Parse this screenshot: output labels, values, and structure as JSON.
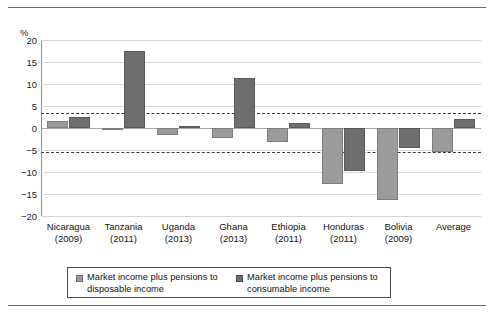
{
  "figure": {
    "y_axis_unit": "%",
    "y_ticks": [
      "20",
      "15",
      "10",
      "5",
      "0",
      "-5",
      "-10",
      "-15",
      "-20"
    ]
  },
  "legend": {
    "items": [
      {
        "swatch": "light",
        "line1": "Market income plus pensions to",
        "line2": "disposable income"
      },
      {
        "swatch": "dark",
        "line1": "Market income plus pensions to",
        "line2": "consumable income"
      }
    ]
  },
  "categories": [
    {
      "name": "Nicaragua",
      "year": "(2009)"
    },
    {
      "name": "Tanzania",
      "year": "(2011)"
    },
    {
      "name": "Uganda",
      "year": "(2013)"
    },
    {
      "name": "Ghana",
      "year": "(2013)"
    },
    {
      "name": "Ethiopia",
      "year": "(2011)"
    },
    {
      "name": "Honduras",
      "year": "(2011)"
    },
    {
      "name": "Bolivia",
      "year": "(2009)"
    },
    {
      "name": "Average",
      "year": ""
    }
  ],
  "chart_data": {
    "type": "bar",
    "title": "",
    "xlabel": "",
    "ylabel": "%",
    "ylim": [
      -20,
      20
    ],
    "ytick_step": 5,
    "grid": true,
    "legend_position": "bottom",
    "categories": [
      "Nicaragua (2009)",
      "Tanzania (2011)",
      "Uganda (2013)",
      "Ghana (2013)",
      "Ethiopia (2011)",
      "Honduras (2011)",
      "Bolivia (2009)",
      "Average"
    ],
    "series": [
      {
        "name": "Market income plus pensions to disposable income",
        "color": "#9b9b9b",
        "values": [
          1.7,
          -0.3,
          -1.5,
          -2.2,
          -3.2,
          -12.8,
          -16.4,
          -5.4
        ]
      },
      {
        "name": "Market income plus pensions to consumable income",
        "color": "#6e6e6e",
        "values": [
          2.4,
          17.6,
          0.4,
          11.4,
          1.1,
          -9.8,
          -4.5,
          2.0
        ]
      }
    ],
    "reference_lines": [
      {
        "value": 3.3,
        "style": "dashed",
        "color": "#3a3a3a"
      },
      {
        "value": -5.5,
        "style": "dashed",
        "color": "#3a3a3a"
      }
    ]
  },
  "colors": {
    "light_bar": "#9b9b9b",
    "dark_bar": "#6e6e6e",
    "gridline": "#d6d6d6",
    "reference": "#3a3a3a"
  }
}
